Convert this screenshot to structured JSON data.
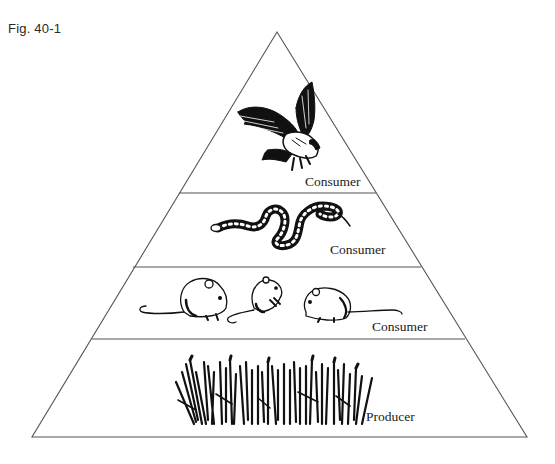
{
  "figure": {
    "label": "Fig. 40-1"
  },
  "pyramid": {
    "line_color": "#555555",
    "background": "#ffffff",
    "tiers": [
      {
        "level": 4,
        "organism": "eagle",
        "icon": "eagle-icon",
        "label": "Consumer"
      },
      {
        "level": 3,
        "organism": "snake",
        "icon": "snake-icon",
        "label": "Consumer"
      },
      {
        "level": 2,
        "organism": "mice",
        "icon": "mouse-icon",
        "count": 3,
        "label": "Consumer"
      },
      {
        "level": 1,
        "organism": "grass",
        "icon": "grass-icon",
        "label": "Producer"
      }
    ]
  }
}
